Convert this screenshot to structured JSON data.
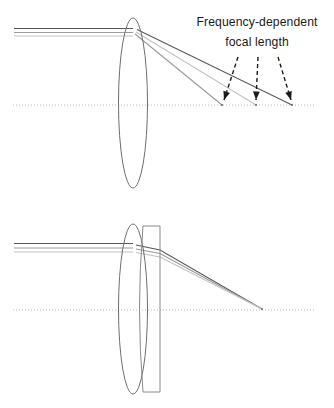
{
  "figure": {
    "width": 334,
    "height": 408,
    "background_color": "#ffffff"
  },
  "annotation": {
    "line1": "Frequency-dependent",
    "line2": "focal length",
    "text_color": "#1b1b1b",
    "anchor_x": 257,
    "line1_y": 26,
    "line2_y": 46
  },
  "colors": {
    "axis": "#b9b9b9",
    "lens_outline": "#6f6f6f",
    "element_outline": "#8a8a8a",
    "ray_dark": "#5a5a5a",
    "ray_medium": "#9a9a9a",
    "ray_light": "#c2c2c2",
    "arrow": "#1b1b1b"
  },
  "panels": [
    {
      "id": "singlet-panel",
      "name": "uncorrected-singlet",
      "axis": {
        "x1": 13,
        "x2": 316,
        "y": 105
      },
      "lens": {
        "name": "biconvex-lens",
        "cx": 133,
        "cy": 103,
        "rx": 14.5,
        "ry": 85
      },
      "incoming_rays": [
        {
          "name": "ray-dark",
          "y": 28.5,
          "x_start": 14,
          "x_end": 133,
          "color": "#5a5a5a"
        },
        {
          "name": "ray-medium",
          "y": 32.5,
          "x_start": 14,
          "x_end": 133,
          "color": "#9a9a9a"
        },
        {
          "name": "ray-light",
          "y": 36.0,
          "x_start": 14,
          "x_end": 133,
          "color": "#c2c2c2"
        }
      ],
      "refracted_rays": [
        {
          "name": "focus-near-ray",
          "color": "#9a9a9a",
          "x_start": 135,
          "y_start": 34.0,
          "x_end": 222,
          "y_end": 105
        },
        {
          "name": "focus-mid-ray",
          "color": "#c2c2c2",
          "x_start": 136,
          "y_start": 32.0,
          "x_end": 256,
          "y_end": 105
        },
        {
          "name": "focus-far-ray",
          "color": "#5a5a5a",
          "x_start": 137,
          "y_start": 29.5,
          "x_end": 292,
          "y_end": 105
        }
      ],
      "focal_points": [
        {
          "name": "focal-point-near",
          "x": 222,
          "y": 105
        },
        {
          "name": "focal-point-mid",
          "x": 256,
          "y": 105
        },
        {
          "name": "focal-point-far",
          "x": 292,
          "y": 105
        }
      ],
      "callout_arrows": [
        {
          "name": "callout-arrow-near",
          "x1": 238,
          "y1": 57,
          "x2": 224,
          "y2": 100
        },
        {
          "name": "callout-arrow-mid",
          "x1": 258,
          "y1": 57,
          "x2": 256,
          "y2": 100
        },
        {
          "name": "callout-arrow-far",
          "x1": 278,
          "y1": 57,
          "x2": 291,
          "y2": 100
        }
      ]
    },
    {
      "id": "achromat-panel",
      "name": "corrected-doublet",
      "axis": {
        "x1": 13,
        "x2": 316,
        "y": 310
      },
      "lens": {
        "name": "biconvex-lens",
        "cx": 133,
        "cy": 309,
        "rx": 14.5,
        "ry": 85
      },
      "corrector": {
        "name": "meniscus-corrector-element",
        "left_x": 143,
        "right_x": 160,
        "top_y": 226,
        "bottom_y": 392,
        "bulge": 7
      },
      "incoming_rays": [
        {
          "name": "ray-dark",
          "y": 243.5,
          "x_start": 14,
          "x_end": 133,
          "color": "#5a5a5a"
        },
        {
          "name": "ray-medium",
          "y": 248.0,
          "x_start": 14,
          "x_end": 133,
          "color": "#9a9a9a"
        },
        {
          "name": "ray-light",
          "y": 252.0,
          "x_start": 14,
          "x_end": 133,
          "color": "#c2c2c2"
        }
      ],
      "refracted_rays": [
        {
          "name": "converging-ray-dark",
          "color": "#5a5a5a",
          "x_start": 136,
          "y_start": 245.0,
          "x_mid": 160,
          "y_mid": 250.0,
          "x_end": 262,
          "y_end": 309
        },
        {
          "name": "converging-ray-medium",
          "color": "#9a9a9a",
          "x_start": 136,
          "y_start": 249.0,
          "x_mid": 160,
          "y_mid": 253.5,
          "x_end": 262,
          "y_end": 309
        },
        {
          "name": "converging-ray-light",
          "color": "#c2c2c2",
          "x_start": 136,
          "y_start": 252.5,
          "x_mid": 160,
          "y_mid": 257.0,
          "x_end": 262,
          "y_end": 309
        }
      ],
      "focal_points": [
        {
          "name": "common-focal-point",
          "x": 262,
          "y": 309
        }
      ],
      "callout_arrows": []
    }
  ]
}
